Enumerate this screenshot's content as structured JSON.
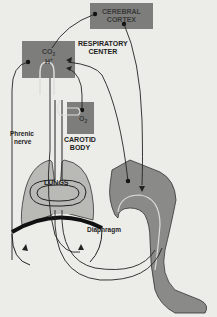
{
  "labels": {
    "cerebral_cortex_1": "CEREBRAL",
    "cerebral_cortex_2": "CORTEX",
    "respiratory_center_1": "RESPIRATORY",
    "respiratory_center_2": "CENTER",
    "co2": "CO",
    "co2_sub": "2",
    "h_ion": "H",
    "h_sup": "+",
    "o2": "O",
    "o2_sub": "2",
    "carotid_1": "CAROTID",
    "carotid_2": "BODY",
    "phrenic_1": "Phrenic",
    "phrenic_2": "nerve",
    "lungs": "LUNGS",
    "diaphragm": "Diaphragm"
  },
  "colors": {
    "background": "#ecece8",
    "box_fill": "#7d7d7b",
    "lung_fill": "#b9b9b6",
    "leg_fill": "#8a8a88",
    "line": "#1e1e1e",
    "diaphragm": "#111111"
  }
}
